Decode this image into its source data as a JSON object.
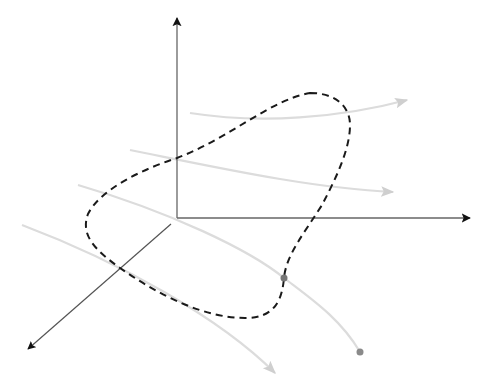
{
  "diagram": {
    "colors": {
      "background": "#ffffff",
      "axis": "#555555",
      "axis_arrow": "#111111",
      "flow_line": "#dcdcdc",
      "flow_arrow": "#cfcfcf",
      "dashed_curve": "#1a1a1a",
      "marker": "#888888"
    },
    "axes": {
      "origin": [
        177,
        218
      ],
      "z_axis_end": [
        177,
        18
      ],
      "x_axis_end": [
        470,
        218
      ],
      "y_axis_start": [
        171,
        224
      ],
      "y_axis_end": [
        28,
        349
      ]
    },
    "flow_lines": [
      {
        "id": "flow-1",
        "path": "M 190 113 C 260 124, 340 118, 407 100",
        "end": "arrow"
      },
      {
        "id": "flow-2",
        "path": "M 130 150 C 220 168, 310 188, 393 192",
        "end": "arrow"
      },
      {
        "id": "flow-3",
        "path": "M 78 185 C 170 212, 250 250, 284 278 C 310 298, 340 318, 360 352",
        "end": "dot"
      },
      {
        "id": "flow-4",
        "path": "M 22 225 C 120 262, 220 318, 275 373",
        "end": "arrow"
      }
    ],
    "dashed_curve": {
      "path": "M 310 93 C 335 93, 350 106, 350 125 C 350 150, 335 180, 322 205 C 305 232, 286 255, 284 278 C 282 300, 275 318, 245 318 C 205 318, 160 296, 120 268 C 95 250, 80 235, 88 214 C 100 190, 140 170, 177 158 C 230 138, 270 100, 310 93 Z",
      "dash": "7 5"
    },
    "markers": [
      {
        "id": "intersection-point",
        "cx": 284,
        "cy": 278,
        "r": 3.5
      },
      {
        "id": "endpoint",
        "cx": 360,
        "cy": 352,
        "r": 3.5
      }
    ]
  }
}
